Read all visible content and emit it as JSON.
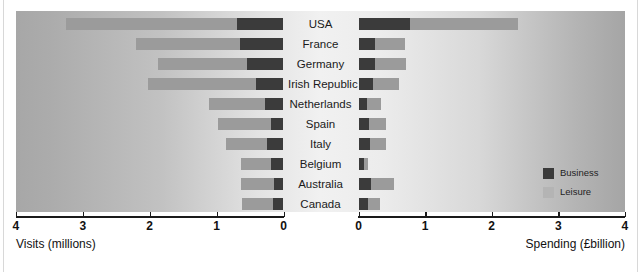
{
  "chart_data": {
    "type": "bar",
    "orientation": "horizontal-diverging",
    "title": "",
    "categories": [
      "USA",
      "France",
      "Germany",
      "Irish Republic",
      "Netherlands",
      "Spain",
      "Italy",
      "Belgium",
      "Australia",
      "Canada"
    ],
    "panels": [
      {
        "name": "visits",
        "side": "left",
        "xlabel": "Visits (millions)",
        "ticks": [
          4,
          3,
          2,
          1,
          0
        ],
        "tick_labels": [
          "4",
          "3",
          "2",
          "1",
          "0"
        ],
        "xlim": [
          4,
          0
        ],
        "direction": "reversed",
        "series": [
          {
            "name": "Leisure",
            "values": [
              2.55,
              1.55,
              1.32,
              1.62,
              0.85,
              0.79,
              0.62,
              0.44,
              0.49,
              0.47
            ]
          },
          {
            "name": "Business",
            "values": [
              0.7,
              0.65,
              0.55,
              0.41,
              0.27,
              0.19,
              0.24,
              0.19,
              0.14,
              0.15
            ]
          }
        ],
        "totals": [
          3.25,
          2.2,
          1.87,
          2.03,
          1.12,
          0.98,
          0.86,
          0.63,
          0.63,
          0.62
        ]
      },
      {
        "name": "spending",
        "side": "right",
        "xlabel": "Spending (£billion)",
        "ticks": [
          0,
          1,
          2,
          3,
          4
        ],
        "tick_labels": [
          "0",
          "1",
          "2",
          "3",
          "4"
        ],
        "xlim": [
          0,
          4
        ],
        "direction": "normal",
        "series": [
          {
            "name": "Business",
            "values": [
              0.77,
              0.25,
              0.25,
              0.22,
              0.13,
              0.16,
              0.17,
              0.09,
              0.19,
              0.15
            ]
          },
          {
            "name": "Leisure",
            "values": [
              1.63,
              0.45,
              0.47,
              0.39,
              0.21,
              0.26,
              0.25,
              0.05,
              0.35,
              0.18
            ]
          }
        ],
        "totals": [
          2.4,
          0.7,
          0.72,
          0.61,
          0.34,
          0.42,
          0.42,
          0.14,
          0.54,
          0.33
        ]
      }
    ],
    "legend": {
      "position": "inside-bottom-right",
      "entries": [
        {
          "label": "Business",
          "color": "#3b3b3b"
        },
        {
          "label": "Leisure",
          "color": "#b4b4b4"
        }
      ]
    },
    "grid": false,
    "colors": {
      "business": "#3b3b3b",
      "leisure": "#9b9b9b",
      "axis": "#1a1a1a",
      "text": "#111111"
    }
  }
}
